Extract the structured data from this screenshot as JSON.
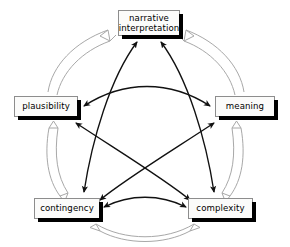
{
  "diagram": {
    "background_color": "#ffffff",
    "node_fill_color": "#fbfbfa",
    "node_border_color": "#8d8d8d",
    "node_shadow_color": "#000000",
    "outer_arrow_color": "#a8a8a8",
    "inner_arrow_color": "#111111",
    "nodes": [
      {
        "id": "narrative",
        "label": "narrative\ninterpretation"
      },
      {
        "id": "plausibility",
        "label": "plausibility"
      },
      {
        "id": "meaning",
        "label": "meaning"
      },
      {
        "id": "contingency",
        "label": "contingency"
      },
      {
        "id": "complexity",
        "label": "complexity"
      }
    ],
    "edges": [
      {
        "id": "outer-plausibility-narrative",
        "style": "hollow-outline",
        "from": "plausibility",
        "to": "narrative",
        "direction": "one-way"
      },
      {
        "id": "outer-meaning-narrative",
        "style": "hollow-outline",
        "from": "meaning",
        "to": "narrative",
        "direction": "one-way"
      },
      {
        "id": "outer-plausibility-contingency",
        "style": "hollow-outline",
        "from": "plausibility",
        "to": "contingency",
        "direction": "two-way"
      },
      {
        "id": "outer-meaning-complexity",
        "style": "hollow-outline",
        "from": "meaning",
        "to": "complexity",
        "direction": "two-way"
      },
      {
        "id": "outer-contingency-complexity",
        "style": "hollow-outline",
        "from": "contingency",
        "to": "complexity",
        "direction": "two-way"
      },
      {
        "id": "inner-plausibility-meaning",
        "style": "solid-black",
        "from": "plausibility",
        "to": "meaning",
        "direction": "two-way"
      },
      {
        "id": "inner-contingency-complexity",
        "style": "solid-black",
        "from": "contingency",
        "to": "complexity",
        "direction": "two-way"
      },
      {
        "id": "inner-narrative-contingency",
        "style": "solid-black",
        "from": "narrative",
        "to": "contingency",
        "direction": "two-way"
      },
      {
        "id": "inner-narrative-complexity",
        "style": "solid-black",
        "from": "narrative",
        "to": "complexity",
        "direction": "two-way"
      },
      {
        "id": "inner-plausibility-complexity",
        "style": "solid-black",
        "from": "plausibility",
        "to": "complexity",
        "direction": "two-way"
      },
      {
        "id": "inner-meaning-contingency",
        "style": "solid-black",
        "from": "meaning",
        "to": "contingency",
        "direction": "two-way"
      }
    ]
  }
}
